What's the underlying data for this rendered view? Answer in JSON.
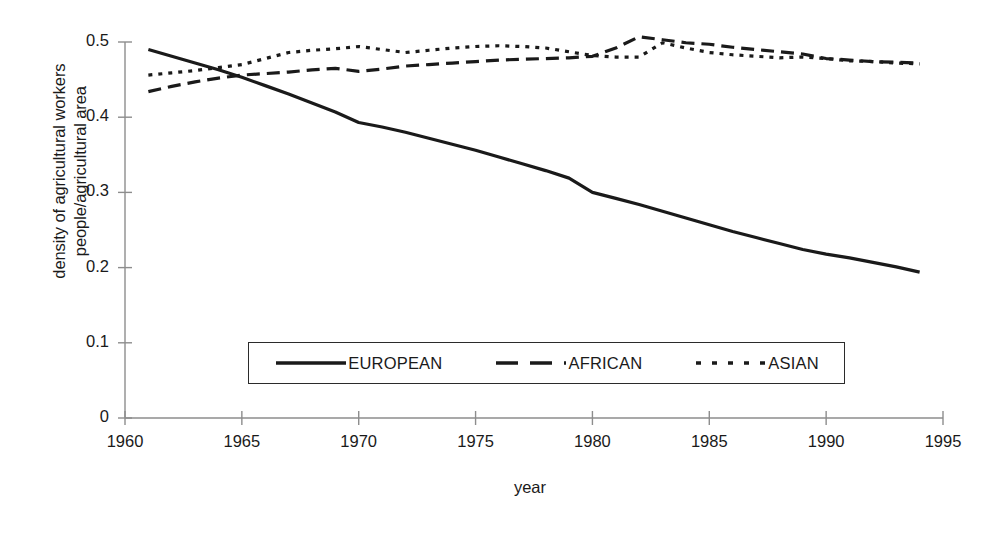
{
  "chart_data": {
    "type": "line",
    "title": "",
    "xlabel": "year",
    "ylabel": "density of agricultural workers people/agricultural area",
    "ylabel_lines": [
      "density of agricultural workers",
      "people/agricultural area"
    ],
    "xlim": [
      1960,
      1995
    ],
    "ylim": [
      0,
      0.5
    ],
    "xticks": [
      1960,
      1965,
      1970,
      1975,
      1980,
      1985,
      1990,
      1995
    ],
    "xtick_labels": [
      "1960",
      "1965",
      "1970",
      "1975",
      "1980",
      "1985",
      "1990",
      "1995"
    ],
    "yticks": [
      0,
      0.1,
      0.2,
      0.3,
      0.4,
      0.5
    ],
    "ytick_labels": [
      "0",
      "0.1",
      "0.2",
      "0.3",
      "0.4",
      "0.5"
    ],
    "grid": false,
    "legend_position": "inside-lower-center",
    "x": [
      1961,
      1962,
      1963,
      1964,
      1965,
      1966,
      1967,
      1968,
      1969,
      1970,
      1971,
      1972,
      1973,
      1974,
      1975,
      1976,
      1977,
      1978,
      1979,
      1980,
      1981,
      1982,
      1983,
      1984,
      1985,
      1986,
      1987,
      1988,
      1989,
      1990,
      1991,
      1992,
      1993,
      1994
    ],
    "series": [
      {
        "name": "EUROPEAN",
        "style": "solid",
        "color": "#1a1a1a",
        "values": [
          0.49,
          0.481,
          0.472,
          0.463,
          0.453,
          0.442,
          0.431,
          0.419,
          0.407,
          0.393,
          0.387,
          0.38,
          0.372,
          0.364,
          0.356,
          0.347,
          0.338,
          0.329,
          0.319,
          0.3,
          0.292,
          0.284,
          0.275,
          0.266,
          0.257,
          0.248,
          0.24,
          0.232,
          0.224,
          0.218,
          0.213,
          0.207,
          0.201,
          0.194
        ]
      },
      {
        "name": "AFRICAN",
        "style": "dashed",
        "color": "#1a1a1a",
        "values": [
          0.434,
          0.441,
          0.447,
          0.452,
          0.456,
          0.458,
          0.46,
          0.463,
          0.465,
          0.461,
          0.464,
          0.468,
          0.47,
          0.472,
          0.474,
          0.476,
          0.477,
          0.478,
          0.479,
          0.481,
          0.492,
          0.507,
          0.503,
          0.499,
          0.497,
          0.493,
          0.49,
          0.487,
          0.484,
          0.478,
          0.476,
          0.474,
          0.473,
          0.472
        ]
      },
      {
        "name": "ASIAN",
        "style": "dotted",
        "color": "#1a1a1a",
        "values": [
          0.456,
          0.459,
          0.462,
          0.466,
          0.47,
          0.478,
          0.486,
          0.489,
          0.491,
          0.494,
          0.49,
          0.486,
          0.489,
          0.492,
          0.494,
          0.495,
          0.494,
          0.492,
          0.487,
          0.482,
          0.48,
          0.48,
          0.499,
          0.492,
          0.486,
          0.483,
          0.481,
          0.479,
          0.48,
          0.478,
          0.475,
          0.474,
          0.472,
          0.471
        ]
      }
    ]
  },
  "legend": {
    "items": [
      {
        "label": "EUROPEAN",
        "style": "solid"
      },
      {
        "label": "AFRICAN",
        "style": "dashed"
      },
      {
        "label": "ASIAN",
        "style": "dotted"
      }
    ]
  }
}
